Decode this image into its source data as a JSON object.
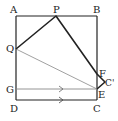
{
  "diagram": {
    "type": "geometry-folded-square",
    "points": {
      "A": {
        "label": "A",
        "x": 16,
        "y": 16
      },
      "B": {
        "label": "B",
        "x": 97,
        "y": 16
      },
      "C": {
        "label": "C",
        "x": 97,
        "y": 100
      },
      "D": {
        "label": "D",
        "x": 16,
        "y": 100
      },
      "P": {
        "label": "P",
        "x": 56,
        "y": 16
      },
      "Q": {
        "label": "Q",
        "x": 16,
        "y": 49
      },
      "F": {
        "label": "F",
        "x": 97,
        "y": 74
      },
      "C_prime": {
        "label": "C'",
        "x": 105,
        "y": 82
      },
      "E": {
        "label": "E",
        "x": 97,
        "y": 89
      },
      "G": {
        "label": "G",
        "x": 16,
        "y": 89
      }
    },
    "segments": [
      {
        "from": "A",
        "to": "B",
        "style": "thin"
      },
      {
        "from": "A",
        "to": "D",
        "style": "thin"
      },
      {
        "from": "D",
        "to": "C",
        "style": "thin",
        "arrow": true
      },
      {
        "from": "B",
        "to": "C",
        "style": "thin"
      },
      {
        "from": "Q",
        "to": "P",
        "style": "thick"
      },
      {
        "from": "P",
        "to": "F",
        "style": "thick"
      },
      {
        "from": "F",
        "to": "C_prime",
        "style": "thick"
      },
      {
        "from": "C_prime",
        "to": "E",
        "style": "thick"
      },
      {
        "from": "Q",
        "to": "E",
        "style": "gray"
      },
      {
        "from": "G",
        "to": "E",
        "style": "gray",
        "arrow": true
      }
    ],
    "colors": {
      "line": "#222222",
      "gray_line": "#888888"
    }
  }
}
